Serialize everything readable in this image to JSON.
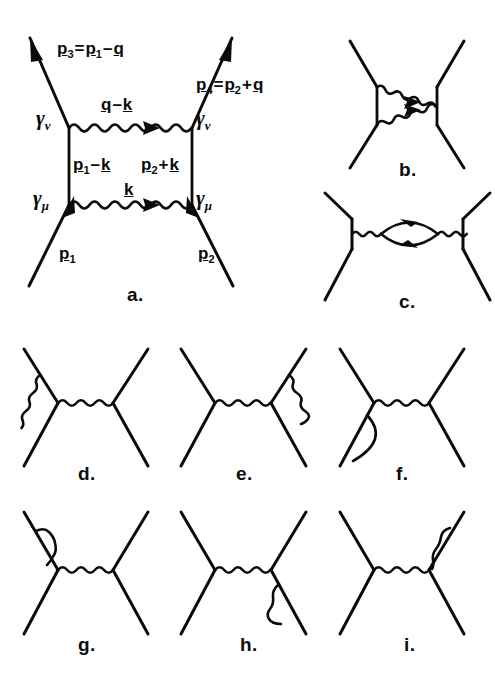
{
  "figure": {
    "kind": "feynman-diagram-plate",
    "background_color": "#ffffff",
    "ink_color": "#0b0b0b",
    "width": 495,
    "height": 691
  },
  "panels": [
    {
      "id": "a",
      "letter": "a.",
      "description": "box diagram with two photon exchanges",
      "labels": {
        "out_left": "p3 = p1 - q",
        "out_right": "p4 = p2 + q",
        "in_left": "p1",
        "in_right": "p2",
        "top_photon": "q - k",
        "bottom_photon": "k",
        "left_internal": "p1 - k",
        "right_internal": "p2 + k",
        "vertex_top_left": "gamma_nu",
        "vertex_top_right": "gamma_nu",
        "vertex_bottom_left": "gamma_mu",
        "vertex_bottom_right": "gamma_mu"
      }
    },
    {
      "id": "b",
      "letter": "b.",
      "description": "crossed box diagram"
    },
    {
      "id": "c",
      "letter": "c.",
      "description": "vacuum polarization bubble on photon propagator"
    },
    {
      "id": "d",
      "letter": "d.",
      "description": "vertex correction on left vertex"
    },
    {
      "id": "e",
      "letter": "e.",
      "description": "vertex correction on right vertex"
    },
    {
      "id": "f",
      "letter": "f.",
      "description": "self-energy insertion on lower-left leg"
    },
    {
      "id": "g",
      "letter": "g.",
      "description": "self-energy insertion on upper-left leg"
    },
    {
      "id": "h",
      "letter": "h.",
      "description": "self-energy insertion on lower-right leg"
    },
    {
      "id": "i",
      "letter": "i.",
      "description": "self-energy insertion on upper-right leg"
    }
  ],
  "text": {
    "p3_p": "p",
    "p3_sub": "3",
    "p3_eq": "=",
    "p3_p1": "p",
    "p3_p1sub": "1",
    "p3_minus": "–",
    "p3_q": "q",
    "p4_p": "p",
    "p4_sub": "4",
    "p4_eq": "=",
    "p4_p2": "p",
    "p4_p2sub": "2",
    "p4_plus": "+",
    "p4_q": "q",
    "qmk_q": "q",
    "qmk_minus": "–",
    "qmk_k": "k",
    "k_only": "k",
    "left_int_p": "p",
    "left_int_sub": "1",
    "left_int_minus": "–",
    "left_int_k": "k",
    "right_int_p": "p",
    "right_int_sub": "2",
    "right_int_plus": "+",
    "right_int_k": "k",
    "p1_p": "p",
    "p1_sub": "1",
    "p2_p": "p",
    "p2_sub": "2",
    "gamma": "γ",
    "nu": "ν",
    "mu": "μ",
    "letter_a": "a.",
    "letter_b": "b.",
    "letter_c": "c.",
    "letter_d": "d.",
    "letter_e": "e.",
    "letter_f": "f.",
    "letter_g": "g.",
    "letter_h": "h.",
    "letter_i": "i."
  }
}
